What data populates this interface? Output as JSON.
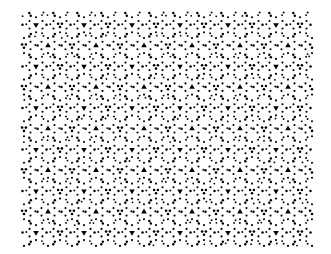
{
  "image": {
    "description": "Dense black-on-white decorative pattern of small dots and trefoil/triangle shapes arranged in a quasi-periodic rosette tiling",
    "background_color": "#ffffff",
    "ink_color": "#000000",
    "pattern_bounds": {
      "x": 22,
      "y": 12,
      "width": 290,
      "height": 236
    },
    "motifs": [
      "dot",
      "triangle",
      "trefoil"
    ]
  }
}
